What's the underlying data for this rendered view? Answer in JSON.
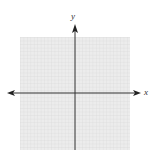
{
  "diagram": {
    "type": "cartesian-coordinate-plane",
    "axes": {
      "x_label": "x",
      "y_label": "y",
      "x_axis_arrows": "both",
      "y_axis_arrows": "up"
    },
    "grid": {
      "visible": true,
      "color": "#d9d9d9",
      "background": "#eeeeee",
      "columns": 32,
      "rows": 32
    },
    "colors": {
      "axis": "#333333",
      "page_background": "#ffffff"
    }
  }
}
